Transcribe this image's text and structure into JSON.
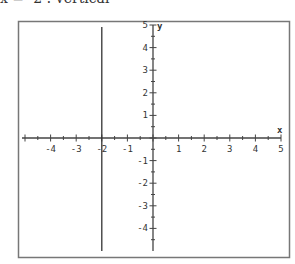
{
  "chart_data": {
    "type": "line",
    "title": "x = -2 : vertical",
    "xlabel": "x",
    "ylabel": "y",
    "xlim": [
      -5,
      5
    ],
    "ylim": [
      -5,
      5
    ],
    "grid": false,
    "x_ticks": [
      -4,
      -3,
      -2,
      -1,
      1,
      2,
      3,
      4,
      5
    ],
    "y_ticks": [
      -4,
      -3,
      -2,
      -1,
      1,
      2,
      3,
      4,
      5
    ],
    "minor_tick_step": 0.5,
    "series": [
      {
        "name": "x = -2",
        "kind": "vertical-line",
        "x": [
          -2,
          -2
        ],
        "y": [
          -5,
          5
        ]
      }
    ]
  },
  "labels": {
    "x_axis_label": "x",
    "y_axis_label": "y"
  },
  "colors": {
    "axis": "#444444",
    "frame": "#777777",
    "line": "#333333",
    "text": "#333333"
  }
}
